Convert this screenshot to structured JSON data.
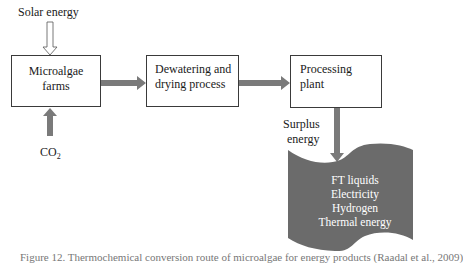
{
  "diagram": {
    "inputs": {
      "solar": "Solar energy",
      "co2_main": "CO",
      "co2_sub": "2"
    },
    "boxes": [
      {
        "id": "microalgae-farms",
        "line1": "Microalgae",
        "line2": "farms"
      },
      {
        "id": "dewatering-drying",
        "line1": "Dewatering and",
        "line2": "drying process"
      },
      {
        "id": "processing-plant",
        "line1": "Processing",
        "line2": "plant"
      }
    ],
    "surplus_label": {
      "line1": "Surplus",
      "line2": "energy"
    },
    "outputs": [
      "FT liquids",
      "Electricity",
      "Hydrogen",
      "Thermal energy"
    ],
    "caption": "Figure 12. Thermochemical conversion route of microalgae for energy products (Raadal et al., 2009)"
  },
  "colors": {
    "arrow_fill": "#7a7a7a",
    "flag_fill": "#6b6b6b",
    "box_border": "#3a3a3a",
    "text": "#1a1a1a"
  }
}
